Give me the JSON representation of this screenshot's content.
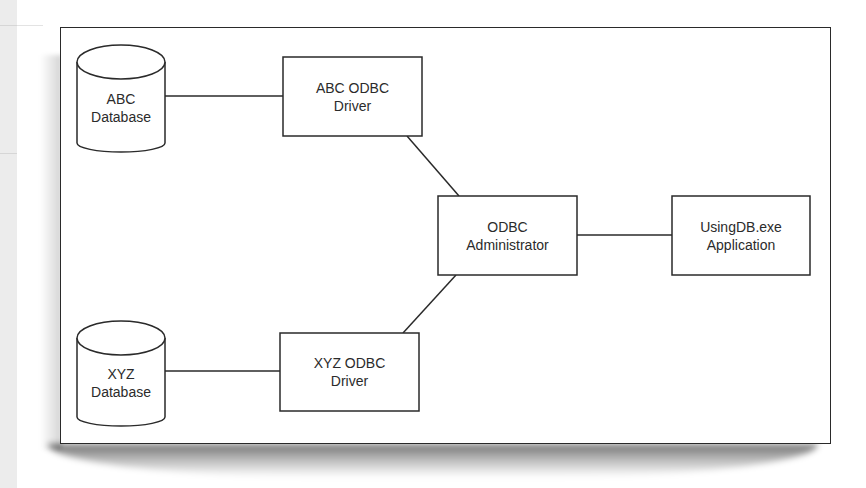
{
  "diagram": {
    "colors": {
      "stroke": "#2a2a2a",
      "text": "#2b2b2b",
      "background": "#ffffff",
      "side_strip": "#ececec"
    },
    "nodes": [
      {
        "id": "abc_db",
        "shape": "cylinder",
        "line1": "ABC",
        "line2": "Database"
      },
      {
        "id": "xyz_db",
        "shape": "cylinder",
        "line1": "XYZ",
        "line2": "Database"
      },
      {
        "id": "abc_driver",
        "shape": "rect",
        "line1": "ABC ODBC",
        "line2": "Driver"
      },
      {
        "id": "xyz_driver",
        "shape": "rect",
        "line1": "XYZ ODBC",
        "line2": "Driver"
      },
      {
        "id": "odbc_admin",
        "shape": "rect",
        "line1": "ODBC",
        "line2": "Administrator"
      },
      {
        "id": "app",
        "shape": "rect",
        "line1": "UsingDB.exe",
        "line2": "Application"
      }
    ],
    "edges": [
      {
        "from": "abc_db",
        "to": "abc_driver"
      },
      {
        "from": "xyz_db",
        "to": "xyz_driver"
      },
      {
        "from": "abc_driver",
        "to": "odbc_admin"
      },
      {
        "from": "xyz_driver",
        "to": "odbc_admin"
      },
      {
        "from": "odbc_admin",
        "to": "app"
      }
    ]
  }
}
